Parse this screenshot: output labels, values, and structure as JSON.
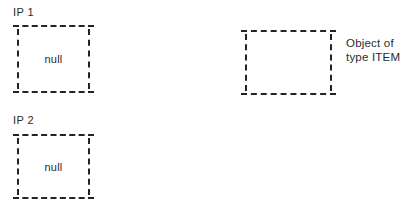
{
  "diagram": {
    "background_color": "#ffffff",
    "stroke_color": "#232323",
    "text_color": "#2b2b2b",
    "slots": [
      {
        "id": "ip1",
        "label": "IP 1",
        "value": "null",
        "border_style": "dashed"
      },
      {
        "id": "ip2",
        "label": "IP 2",
        "value": "null",
        "border_style": "dashed"
      }
    ],
    "object_box": {
      "id": "item",
      "value": "",
      "border_style": "dashed",
      "annotation": "Object of\ntype ITEM"
    }
  }
}
